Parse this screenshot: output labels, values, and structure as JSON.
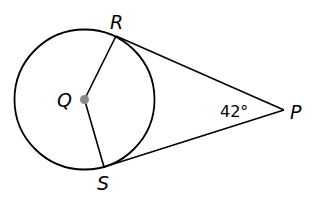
{
  "diagram": {
    "type": "geometry",
    "circle": {
      "center_label": "Q",
      "cx": 84.5,
      "cy": 99.5,
      "r": 70
    },
    "points": {
      "Q": {
        "label": "Q",
        "x": 84.5,
        "y": 99.5
      },
      "R": {
        "label": "R",
        "x": 116,
        "y": 36
      },
      "S": {
        "label": "S",
        "x": 104,
        "y": 167
      },
      "P": {
        "label": "P",
        "x": 284,
        "y": 110
      }
    },
    "segments": [
      {
        "from": "Q",
        "to": "R",
        "kind": "radius"
      },
      {
        "from": "Q",
        "to": "S",
        "kind": "radius"
      },
      {
        "from": "R",
        "to": "P",
        "kind": "tangent"
      },
      {
        "from": "S",
        "to": "P",
        "kind": "tangent"
      }
    ],
    "angle": {
      "vertex": "P",
      "value": "42°"
    },
    "colors": {
      "stroke": "#000000",
      "center_dot": "#8a8a8a",
      "background": "#ffffff"
    }
  }
}
